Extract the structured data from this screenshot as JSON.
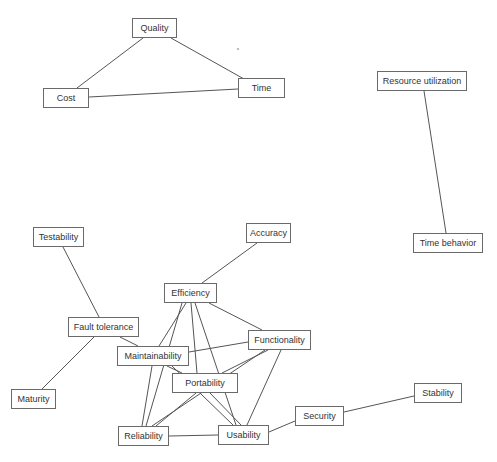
{
  "diagram": {
    "title": "",
    "nodes": [
      {
        "id": "quality",
        "label": "Quality",
        "x": 132,
        "y": 18,
        "w": 45,
        "h": 20
      },
      {
        "id": "cost",
        "label": "Cost",
        "x": 43,
        "y": 88,
        "w": 46,
        "h": 20
      },
      {
        "id": "time",
        "label": "Time",
        "x": 238,
        "y": 78,
        "w": 47,
        "h": 20
      },
      {
        "id": "resource_utilization",
        "label": "Resource utilization",
        "x": 377,
        "y": 71,
        "w": 90,
        "h": 20
      },
      {
        "id": "time_behavior",
        "label": "Time behavior",
        "x": 413,
        "y": 233,
        "w": 70,
        "h": 20
      },
      {
        "id": "testability",
        "label": "Testability",
        "x": 33,
        "y": 227,
        "w": 51,
        "h": 20
      },
      {
        "id": "accuracy",
        "label": "Accuracy",
        "x": 246,
        "y": 223,
        "w": 45,
        "h": 20
      },
      {
        "id": "efficiency",
        "label": "Efficiency",
        "x": 164,
        "y": 283,
        "w": 53,
        "h": 20
      },
      {
        "id": "fault_tolerance",
        "label": "Fault tolerance",
        "x": 68,
        "y": 317,
        "w": 71,
        "h": 20
      },
      {
        "id": "functionality",
        "label": "Functionality",
        "x": 248,
        "y": 330,
        "w": 63,
        "h": 20
      },
      {
        "id": "maintainability",
        "label": "Maintainability",
        "x": 117,
        "y": 346,
        "w": 72,
        "h": 20
      },
      {
        "id": "portability",
        "label": "Portability",
        "x": 172,
        "y": 373,
        "w": 66,
        "h": 20
      },
      {
        "id": "maturity",
        "label": "Maturity",
        "x": 11,
        "y": 389,
        "w": 45,
        "h": 20
      },
      {
        "id": "reliability",
        "label": "Reliability",
        "x": 118,
        "y": 426,
        "w": 51,
        "h": 20
      },
      {
        "id": "usability",
        "label": "Usability",
        "x": 218,
        "y": 425,
        "w": 51,
        "h": 20
      },
      {
        "id": "security",
        "label": "Security",
        "x": 295,
        "y": 406,
        "w": 49,
        "h": 20
      },
      {
        "id": "stability",
        "label": "Stability",
        "x": 414,
        "y": 383,
        "w": 48,
        "h": 20
      }
    ],
    "edges": [
      {
        "from": "quality",
        "to": "cost",
        "x1": 143,
        "y1": 38,
        "x2": 77,
        "y2": 88
      },
      {
        "from": "quality",
        "to": "time",
        "x1": 171,
        "y1": 38,
        "x2": 244,
        "y2": 79
      },
      {
        "from": "cost",
        "to": "time",
        "x1": 89,
        "y1": 97,
        "x2": 238,
        "y2": 89
      },
      {
        "from": "resource_utilization",
        "to": "time_behavior",
        "x1": 424,
        "y1": 91,
        "x2": 446,
        "y2": 233
      },
      {
        "from": "testability",
        "to": "fault_tolerance",
        "x1": 63,
        "y1": 247,
        "x2": 99,
        "y2": 317
      },
      {
        "from": "fault_tolerance",
        "to": "maturity",
        "x1": 94,
        "y1": 337,
        "x2": 42,
        "y2": 389
      },
      {
        "from": "fault_tolerance",
        "to": "maintainability",
        "x1": 120,
        "y1": 337,
        "x2": 138,
        "y2": 346
      },
      {
        "from": "accuracy",
        "to": "efficiency",
        "x1": 257,
        "y1": 243,
        "x2": 202,
        "y2": 283
      },
      {
        "from": "efficiency",
        "to": "functionality",
        "x1": 209,
        "y1": 303,
        "x2": 262,
        "y2": 330
      },
      {
        "from": "efficiency",
        "to": "maintainability",
        "x1": 186,
        "y1": 303,
        "x2": 159,
        "y2": 346
      },
      {
        "from": "efficiency",
        "to": "reliability",
        "x1": 182,
        "y1": 303,
        "x2": 146,
        "y2": 426
      },
      {
        "from": "efficiency",
        "to": "portability",
        "x1": 191,
        "y1": 303,
        "x2": 197,
        "y2": 373
      },
      {
        "from": "efficiency",
        "to": "usability",
        "x1": 195,
        "y1": 303,
        "x2": 236,
        "y2": 425
      },
      {
        "from": "maintainability",
        "to": "functionality",
        "x1": 189,
        "y1": 352,
        "x2": 248,
        "y2": 342
      },
      {
        "from": "maintainability",
        "to": "reliability",
        "x1": 152,
        "y1": 366,
        "x2": 142,
        "y2": 426
      },
      {
        "from": "maintainability",
        "to": "portability",
        "x1": 167,
        "y1": 366,
        "x2": 182,
        "y2": 373
      },
      {
        "from": "maintainability",
        "to": "usability",
        "x1": 172,
        "y1": 366,
        "x2": 233,
        "y2": 425
      },
      {
        "from": "functionality",
        "to": "portability",
        "x1": 268,
        "y1": 350,
        "x2": 222,
        "y2": 373
      },
      {
        "from": "functionality",
        "to": "reliability",
        "x1": 265,
        "y1": 350,
        "x2": 152,
        "y2": 426
      },
      {
        "from": "functionality",
        "to": "usability",
        "x1": 281,
        "y1": 350,
        "x2": 247,
        "y2": 425
      },
      {
        "from": "portability",
        "to": "reliability",
        "x1": 196,
        "y1": 393,
        "x2": 156,
        "y2": 426
      },
      {
        "from": "portability",
        "to": "usability",
        "x1": 210,
        "y1": 393,
        "x2": 241,
        "y2": 425
      },
      {
        "from": "reliability",
        "to": "usability",
        "x1": 169,
        "y1": 436,
        "x2": 218,
        "y2": 435
      },
      {
        "from": "usability",
        "to": "security",
        "x1": 269,
        "y1": 432,
        "x2": 295,
        "y2": 421
      },
      {
        "from": "security",
        "to": "stability",
        "x1": 344,
        "y1": 412,
        "x2": 414,
        "y2": 396
      }
    ],
    "colors": {
      "background": "#ffffff",
      "node_border": "#6a6a6a",
      "edge": "#555555",
      "text": "#333333"
    }
  }
}
